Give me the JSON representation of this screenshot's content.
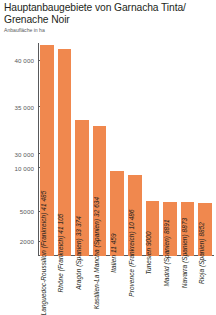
{
  "header": {
    "title": "Hauptanbaugebiete von Garnacha Tinta/ Grenache Noir",
    "subtitle": "Anbaufläche in ha"
  },
  "colors": {
    "bar": "#F0884E",
    "axis": "#58595b",
    "text": "#231f20"
  },
  "chart_data": {
    "type": "bar",
    "title": "Hauptanbaugebiete von Garnacha Tinta/ Grenache Noir",
    "subtitle": "Anbaufläche in ha",
    "xlabel": "",
    "ylabel": "Anbaufläche in ha",
    "grid": false,
    "legend": "none",
    "axis_note": "Nicht-lineare (gebrochene) y-Achse",
    "ytick_labels": [
      "40 000",
      "35 000",
      "30 000",
      "10 000",
      "5000",
      "2000"
    ],
    "ytick_values": [
      40000,
      35000,
      30000,
      10000,
      5000,
      2000
    ],
    "ytick_positions_pct": [
      8.0,
      30.0,
      52.0,
      58.5,
      79.0,
      93.0
    ],
    "categories": [
      "Languedoc-Roussillon (Frankreich)",
      "Rhône (Frankreich)",
      "Aragón (Spanien)",
      "Kastilien-La Mancha (Spanien)",
      "Italien",
      "Provence (Frankreich)",
      "Tunesien",
      "Madrid (Spanien)",
      "Navarra (Spanien)",
      "Rioja (Spanien)"
    ],
    "values": [
      41485,
      41105,
      33374,
      32634,
      11459,
      10486,
      9000,
      8891,
      8873,
      8852
    ],
    "bars": [
      {
        "label": "Languedoc-Roussillon (Frankreich) 41 485",
        "value": 41485,
        "height_pct": 99.0
      },
      {
        "label": "Rhône (Frankreich) 41 105",
        "value": 41105,
        "height_pct": 97.0
      },
      {
        "label": "Aragón (Spanien) 33 374",
        "value": 33374,
        "height_pct": 64.0
      },
      {
        "label": "Kastilien-La Mancha (Spanien) 32 634",
        "value": 32634,
        "height_pct": 61.0
      },
      {
        "label": "Italien 11 459",
        "value": 11459,
        "height_pct": 40.0
      },
      {
        "label": "Provence (Frankreich) 10 486",
        "value": 10486,
        "height_pct": 38.0
      },
      {
        "label": "Tunesien 9000",
        "value": 9000,
        "height_pct": 26.0
      },
      {
        "label": "Madrid (Spanien) 8891",
        "value": 8891,
        "height_pct": 25.4
      },
      {
        "label": "Navarra (Spanien) 8873",
        "value": 8873,
        "height_pct": 25.2
      },
      {
        "label": "Rioja (Spanien) 8852",
        "value": 8852,
        "height_pct": 25.0
      }
    ]
  }
}
